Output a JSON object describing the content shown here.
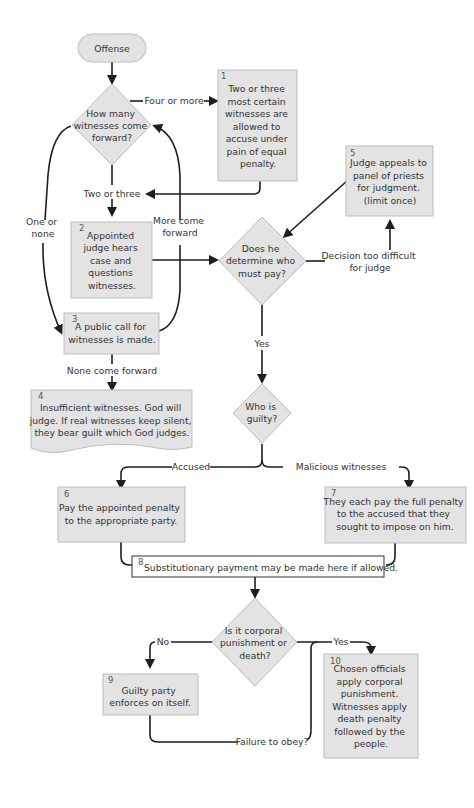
{
  "diagram": {
    "type": "flowchart",
    "colors": {
      "node_fill": "#e3e3e3",
      "node_border": "#bdbdbd",
      "edge": "#1e1e1e",
      "text": "#333333",
      "background": "#ffffff"
    },
    "nodes": {
      "start": {
        "label": "Offense"
      },
      "d1": {
        "lines": [
          "How many",
          "witnesses come",
          "forward?"
        ]
      },
      "n1": {
        "num": "1",
        "lines": [
          "Two or three",
          "most certain",
          "witnesses are",
          "allowed to",
          "accuse under",
          "pain of equal",
          "penalty."
        ]
      },
      "n2": {
        "num": "2",
        "lines": [
          "Appointed",
          "judge hears",
          "case and",
          "questions",
          "witnesses."
        ]
      },
      "n3": {
        "num": "3",
        "lines": [
          "A public call for",
          "witnesses is made."
        ]
      },
      "n4": {
        "num": "4",
        "lines": [
          "Insufficient witnesses. God will",
          "judge. If real witnesses keep silent,",
          "they bear guilt which God judges."
        ]
      },
      "n5": {
        "num": "5",
        "lines": [
          "Judge appeals to",
          "panel of priests",
          "for judgment.",
          "(limit once)"
        ]
      },
      "d2": {
        "lines": [
          "Does he",
          "determine who",
          "must pay?"
        ]
      },
      "d3": {
        "lines": [
          "Who is",
          "guilty?"
        ]
      },
      "n6": {
        "num": "6",
        "lines": [
          "Pay the appointed penalty",
          "to the appropriate party."
        ]
      },
      "n7": {
        "num": "7",
        "lines": [
          "They each pay the full penalty",
          "to the accused that they",
          "sought to impose on him."
        ]
      },
      "n8": {
        "num": "8",
        "lines": [
          "Substitutionary payment may be made here if allowed."
        ]
      },
      "d4": {
        "lines": [
          "Is it corporal",
          "punishment or",
          "death?"
        ]
      },
      "n9": {
        "num": "9",
        "lines": [
          "Guilty party",
          "enforces on itself."
        ]
      },
      "n10": {
        "num": "10",
        "lines": [
          "Chosen officials",
          "apply corporal",
          "punishment.",
          "Witnesses apply",
          "death penalty",
          "followed by the",
          "people."
        ]
      }
    },
    "edge_labels": {
      "four_or_more": "Four or more",
      "two_or_three": "Two or three",
      "one_or_none": [
        "One or",
        "none"
      ],
      "more_come_forward": [
        "More come",
        "forward"
      ],
      "none_come_forward": "None come forward",
      "decision_too_difficult": [
        "Decision too difficult",
        "for judge"
      ],
      "yes": "Yes",
      "accused": "Accused",
      "malicious_witnesses": "Malicious witnesses",
      "no": "No",
      "yes2": "Yes",
      "failure_to_obey": "Failure to obey?"
    }
  }
}
